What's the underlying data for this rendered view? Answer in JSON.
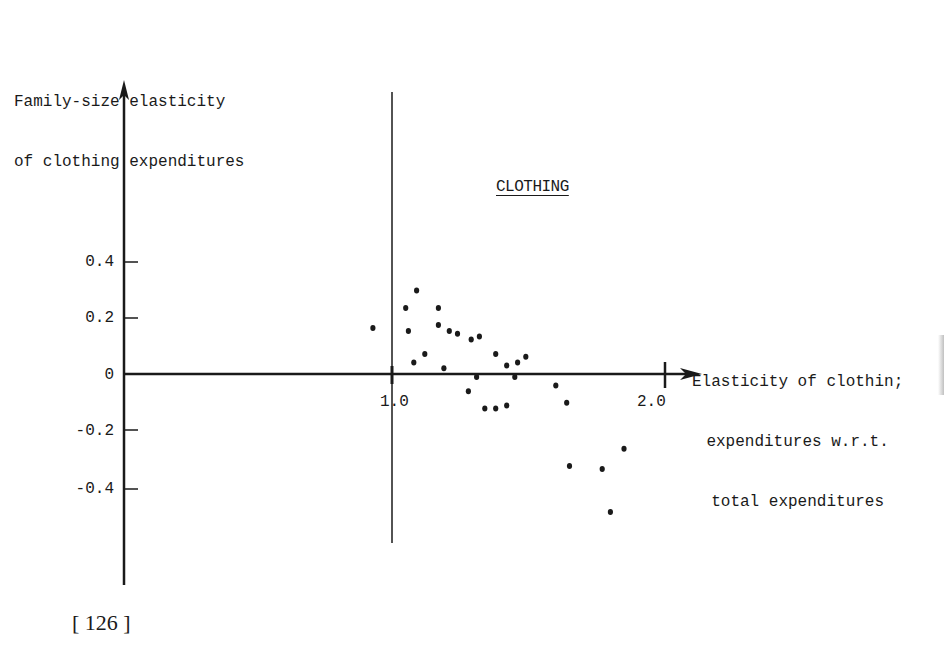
{
  "page": {
    "page_number": "[ 126 ]"
  },
  "chart_data": {
    "type": "scatter",
    "title": "CLOTHING",
    "xlabel": "Elasticity of clothing expenditures w.r.t. total expenditures",
    "xlabel_lines": [
      "Elasticity of clothin;",
      "expenditures w.r.t.",
      "total expenditures"
    ],
    "ylabel": "Family-size elasticity of clothing expenditures",
    "ylabel_lines": [
      "Family-size elasticity",
      "of clothing expenditures"
    ],
    "x_ticks": [
      {
        "value": 1.0,
        "label": "1.0"
      },
      {
        "value": 2.0,
        "label": "2.0"
      }
    ],
    "y_ticks": [
      {
        "value": 0.4,
        "label": "0.4"
      },
      {
        "value": 0.2,
        "label": "0.2"
      },
      {
        "value": 0,
        "label": "0"
      },
      {
        "value": -0.2,
        "label": "-0.2"
      },
      {
        "value": -0.4,
        "label": "-0.4"
      }
    ],
    "xlim": [
      0.0,
      2.1
    ],
    "ylim": [
      -0.8,
      0.95
    ],
    "grid": false,
    "legend": null,
    "reference_lines": [
      {
        "orientation": "vertical",
        "x": 1.0
      }
    ],
    "points": [
      {
        "x": 0.93,
        "y": 0.16
      },
      {
        "x": 1.05,
        "y": 0.23
      },
      {
        "x": 1.09,
        "y": 0.29
      },
      {
        "x": 1.06,
        "y": 0.15
      },
      {
        "x": 1.08,
        "y": 0.04
      },
      {
        "x": 1.12,
        "y": 0.07
      },
      {
        "x": 1.17,
        "y": 0.23
      },
      {
        "x": 1.17,
        "y": 0.17
      },
      {
        "x": 1.19,
        "y": 0.02
      },
      {
        "x": 1.21,
        "y": 0.15
      },
      {
        "x": 1.24,
        "y": 0.14
      },
      {
        "x": 1.29,
        "y": 0.12
      },
      {
        "x": 1.32,
        "y": 0.13
      },
      {
        "x": 1.31,
        "y": -0.01
      },
      {
        "x": 1.28,
        "y": -0.06
      },
      {
        "x": 1.38,
        "y": 0.07
      },
      {
        "x": 1.42,
        "y": 0.03
      },
      {
        "x": 1.46,
        "y": 0.04
      },
      {
        "x": 1.49,
        "y": 0.06
      },
      {
        "x": 1.45,
        "y": -0.01
      },
      {
        "x": 1.34,
        "y": -0.12
      },
      {
        "x": 1.38,
        "y": -0.12
      },
      {
        "x": 1.42,
        "y": -0.11
      },
      {
        "x": 1.6,
        "y": -0.04
      },
      {
        "x": 1.64,
        "y": -0.1
      },
      {
        "x": 1.65,
        "y": -0.32
      },
      {
        "x": 1.77,
        "y": -0.33
      },
      {
        "x": 1.85,
        "y": -0.26
      },
      {
        "x": 1.8,
        "y": -0.48
      }
    ]
  },
  "colors": {
    "ink": "#1a1a1a",
    "background": "#ffffff"
  }
}
